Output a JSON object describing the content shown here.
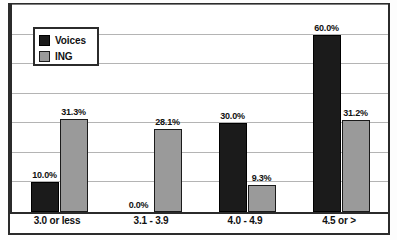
{
  "chart_data": {
    "type": "bar",
    "title": "",
    "xlabel": "",
    "ylabel": "",
    "ylim": [
      0,
      70
    ],
    "grid": true,
    "legend_position": "top-left",
    "categories": [
      "3.0 or less",
      "3.1 - 3.9",
      "4.0 - 4.9",
      "4.5 or >"
    ],
    "series": [
      {
        "name": "Voices",
        "color": "#1b1b1b",
        "values": [
          10.0,
          0.0,
          30.0,
          60.0
        ],
        "labels": [
          "10.0%",
          "0.0%",
          "30.0%",
          "60.0%"
        ]
      },
      {
        "name": "ING",
        "color": "#9a9a9a",
        "values": [
          31.3,
          28.1,
          9.3,
          31.2
        ],
        "labels": [
          "31.3%",
          "28.1%",
          "9.3%",
          "31.2%"
        ]
      }
    ]
  },
  "legend": {
    "items": [
      {
        "label": "Voices",
        "swatch": "legend-swatch-voices"
      },
      {
        "label": "ING",
        "swatch": "legend-swatch-ing"
      }
    ]
  },
  "axis": {
    "categories": [
      "3.0 or less",
      "3.1 - 3.9",
      "4.0 - 4.9",
      "4.5 or >"
    ]
  }
}
